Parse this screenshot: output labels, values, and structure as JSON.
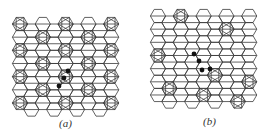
{
  "figure": {
    "colors": {
      "line": "#3a3a3a",
      "dot": "#111111",
      "background": "#ffffff"
    },
    "panels": [
      {
        "id": "a",
        "label": "(a)",
        "lattice": "honeycomb",
        "star_sites": "regular superlattice (every other column, alternating rows)",
        "defect_count": 3
      },
      {
        "id": "b",
        "label": "(b)",
        "lattice": "honeycomb",
        "star_sites": "sparse, irregular",
        "defect_count": 4
      }
    ]
  }
}
